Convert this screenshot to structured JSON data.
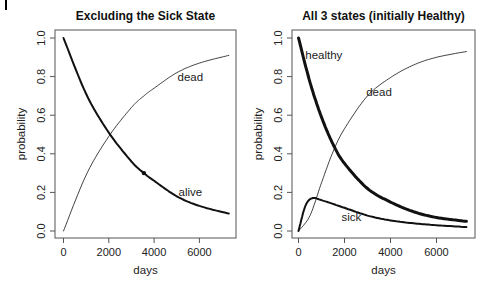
{
  "chart_data": [
    {
      "type": "line",
      "title": "Excluding the Sick State",
      "xlabel": "days",
      "ylabel": "probability",
      "xlim": [
        0,
        7300
      ],
      "ylim": [
        0,
        1
      ],
      "xticks": [
        0,
        2000,
        4000,
        6000
      ],
      "xtick_labels": [
        "0",
        "2000",
        "4000",
        "6000"
      ],
      "yticks": [
        0.0,
        0.2,
        0.4,
        0.6,
        0.8,
        1.0
      ],
      "ytick_labels": [
        "0.0",
        "0.2",
        "0.4",
        "0.6",
        "0.8",
        "1.0"
      ],
      "grid": false,
      "series": [
        {
          "name": "alive",
          "x": [
            0,
            1000,
            2000,
            3000,
            3550,
            4000,
            5000,
            6000,
            7300
          ],
          "values": [
            1.0,
            0.71,
            0.51,
            0.36,
            0.3,
            0.26,
            0.18,
            0.13,
            0.09
          ],
          "line_width": 2
        },
        {
          "name": "dead",
          "x": [
            0,
            1000,
            2000,
            3000,
            3550,
            4000,
            5000,
            6000,
            7300
          ],
          "values": [
            0.0,
            0.29,
            0.49,
            0.64,
            0.7,
            0.74,
            0.82,
            0.87,
            0.91
          ],
          "line_width": 0.8
        }
      ],
      "annotations": [
        {
          "text": "dead",
          "x": 5600,
          "y": 0.8
        },
        {
          "text": "alive",
          "x": 5600,
          "y": 0.2
        },
        {
          "text": "point",
          "x": 3550,
          "y": 0.3
        }
      ]
    },
    {
      "type": "line",
      "title": "All 3 states (initially Healthy)",
      "xlabel": "days",
      "ylabel": "probability",
      "xlim": [
        0,
        7300
      ],
      "ylim": [
        0,
        1
      ],
      "xticks": [
        0,
        2000,
        4000,
        6000
      ],
      "xtick_labels": [
        "0",
        "2000",
        "4000",
        "6000"
      ],
      "yticks": [
        0.0,
        0.2,
        0.4,
        0.6,
        0.8,
        1.0
      ],
      "ytick_labels": [
        "0.0",
        "0.2",
        "0.4",
        "0.6",
        "0.8",
        "1.0"
      ],
      "grid": false,
      "series": [
        {
          "name": "healthy",
          "x": [
            0,
            500,
            1000,
            1500,
            2000,
            3000,
            4000,
            5000,
            6000,
            7300
          ],
          "values": [
            1.0,
            0.77,
            0.59,
            0.45,
            0.35,
            0.22,
            0.15,
            0.1,
            0.07,
            0.05
          ],
          "line_width": 3
        },
        {
          "name": "sick",
          "x": [
            0,
            300,
            600,
            1000,
            2000,
            3000,
            4000,
            5000,
            6000,
            7300
          ],
          "values": [
            0.0,
            0.13,
            0.17,
            0.16,
            0.12,
            0.08,
            0.055,
            0.04,
            0.03,
            0.02
          ],
          "line_width": 2
        },
        {
          "name": "dead",
          "x": [
            0,
            500,
            1000,
            1500,
            2000,
            3000,
            4000,
            5000,
            6000,
            7300
          ],
          "values": [
            0.0,
            0.08,
            0.25,
            0.41,
            0.53,
            0.7,
            0.795,
            0.86,
            0.9,
            0.93
          ],
          "line_width": 0.8
        }
      ],
      "annotations": [
        {
          "text": "healthy",
          "x": 1100,
          "y": 0.91
        },
        {
          "text": "dead",
          "x": 3500,
          "y": 0.72
        },
        {
          "text": "sick",
          "x": 2300,
          "y": 0.07
        }
      ]
    }
  ]
}
